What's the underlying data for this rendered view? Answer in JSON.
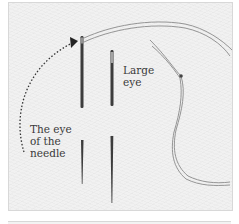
{
  "figure": {
    "labels": {
      "large_eye": "Large\neye",
      "eye_of_needle": "The eye\nof the\nneedle"
    },
    "colors": {
      "background": "#f1f1f1",
      "needle": "#3c3c3c",
      "thread": "#8a8a8a",
      "arrow": "#333333",
      "text": "#3a3a3a"
    },
    "icons": [
      "needle-small-eye",
      "needle-large-eye",
      "thread",
      "dotted-arrow"
    ]
  }
}
